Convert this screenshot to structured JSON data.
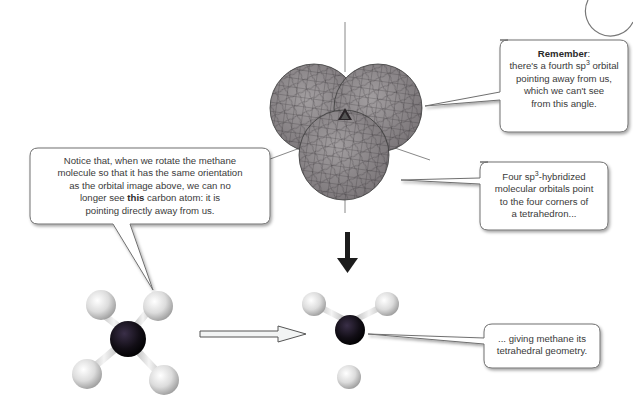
{
  "callouts": {
    "remember": {
      "title": "Remember",
      "title_suffix": ":",
      "line1_pre": "there's a fourth sp",
      "line1_sup": "3",
      "line1_post": " orbital",
      "line2": "pointing away from us,",
      "line3": "which we can't see",
      "line4": "from this angle."
    },
    "four_orbitals": {
      "line1_pre": "Four sp",
      "line1_sup": "3",
      "line1_post": "-hybridized",
      "line2": "molecular orbitals point",
      "line3": "to the four corners of",
      "line4": "a tetrahedron..."
    },
    "notice": {
      "line1": "Notice that, when we rotate the methane",
      "line2": "molecule so that it has the same orientation",
      "line3": "as the orbital image above, we can no",
      "line4_pre": "longer see ",
      "line4_bold": "this",
      "line4_post": " carbon atom: it is",
      "line5": "pointing directly away from us."
    },
    "geometry": {
      "line1": "... giving methane its",
      "line2": "tetrahedral geometry."
    }
  },
  "figures": {
    "orbital_model": "sp3 hybrid orbitals wireframe",
    "methane_side": "methane ball-and-stick (rotated)",
    "methane_top": "methane ball-and-stick (viewed along bond)"
  },
  "colors": {
    "carbon": "#141018",
    "hydrogen": "#e4e4e4",
    "orbital_fill": "#8e8a8c",
    "mesh": "#2e2a2e",
    "callout_border": "#6a6a6a",
    "arrow_dark": "#1c1c1c"
  }
}
